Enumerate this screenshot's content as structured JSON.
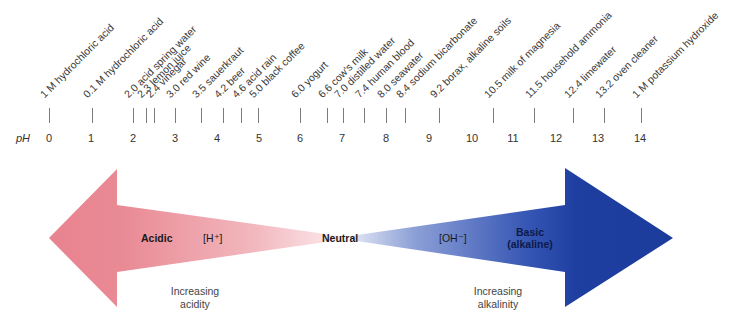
{
  "scale": {
    "axis_label": "pH",
    "numbers": [
      "0",
      "1",
      "2",
      "3",
      "4",
      "5",
      "6",
      "7",
      "8",
      "9",
      "10",
      "11",
      "12",
      "13",
      "14"
    ],
    "substances": [
      {
        "ph": 0.0,
        "label": "1 M hydrochloric acid"
      },
      {
        "ph": 1.0,
        "label": "0.1 M hydrochloric acid"
      },
      {
        "ph": 2.0,
        "label": "2.0 acid spring water"
      },
      {
        "ph": 2.3,
        "label": "2.3 lemon juice"
      },
      {
        "ph": 2.4,
        "label": "2.4 vinegar"
      },
      {
        "ph": 3.0,
        "label": "3.0 red wine"
      },
      {
        "ph": 3.5,
        "label": "3.5 sauerkraut"
      },
      {
        "ph": 4.2,
        "label": "4.2 beer"
      },
      {
        "ph": 4.6,
        "label": "4.6 acid rain"
      },
      {
        "ph": 5.0,
        "label": "5.0 black coffee"
      },
      {
        "ph": 6.0,
        "label": "6.0 yogurt"
      },
      {
        "ph": 6.6,
        "label": "6.6 cow's milk"
      },
      {
        "ph": 7.0,
        "label": "7.0 distilled water"
      },
      {
        "ph": 7.4,
        "label": "7.4 human blood"
      },
      {
        "ph": 8.0,
        "label": "8.0 seawater"
      },
      {
        "ph": 8.4,
        "label": "8.4 sodium bicarbonate"
      },
      {
        "ph": 9.2,
        "label": "9.2 borax, alkaline soils"
      },
      {
        "ph": 10.5,
        "label": "10.5 milk of magnesia"
      },
      {
        "ph": 11.5,
        "label": "11.5 household ammonia"
      },
      {
        "ph": 12.4,
        "label": "12.4 limewater"
      },
      {
        "ph": 13.2,
        "label": "13.2 oven cleaner"
      },
      {
        "ph": 14.0,
        "label": "1 M potassium hydroxide"
      }
    ]
  },
  "arrows": {
    "acid": {
      "label": "Acidic",
      "ion": "[H⁺]",
      "caption_line1": "Increasing",
      "caption_line2": "acidity",
      "color": "#e8838f"
    },
    "neutral": {
      "label": "Neutral"
    },
    "base": {
      "label_line1": "Basic",
      "label_line2": "(alkaline)",
      "ion": "[OH⁻]",
      "caption_line1": "Increasing",
      "caption_line2": "alkalinity",
      "color": "#1e3fa0"
    }
  }
}
